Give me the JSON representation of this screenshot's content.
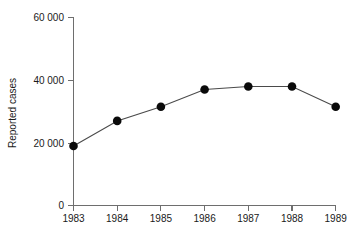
{
  "chart_data": {
    "type": "line",
    "title": "",
    "xlabel": "",
    "ylabel": "Reported cases",
    "x": [
      1983,
      1984,
      1985,
      1986,
      1987,
      1988,
      1989
    ],
    "categories": [
      "1983",
      "1984",
      "1985",
      "1986",
      "1987",
      "1988",
      "1989"
    ],
    "values": [
      19000,
      27000,
      31500,
      37000,
      38000,
      38000,
      31500
    ],
    "series": [
      {
        "name": "Reported cases",
        "values": [
          19000,
          27000,
          31500,
          37000,
          38000,
          38000,
          31500
        ]
      }
    ],
    "xlim": [
      1983,
      1989
    ],
    "ylim": [
      0,
      60000
    ],
    "ytick_labels": [
      "60 000",
      "40 000",
      "20 000",
      "0"
    ],
    "ytick_values": [
      60000,
      40000,
      20000,
      0
    ],
    "xtick_labels": [
      "1983",
      "1984",
      "1985",
      "1986",
      "1987",
      "1988",
      "1989"
    ],
    "grid": false,
    "legend": false,
    "legend_position": "none",
    "marker": "filled-circle",
    "colors": {
      "line": "#4a4a4a",
      "marker": "#0a0a0a",
      "axis": "#6e6e6e",
      "text": "#1a1a1a",
      "background": "#ffffff"
    }
  }
}
